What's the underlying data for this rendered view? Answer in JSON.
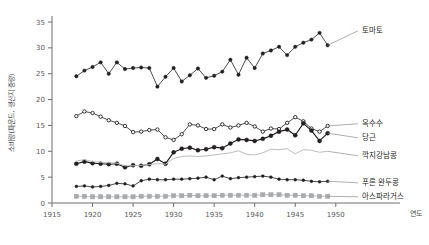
{
  "chart_data": {
    "type": "line",
    "title": "",
    "xlabel": "연도",
    "ylabel": "소비량(파운드, 생산지 중량)",
    "xlim": [
      1915,
      1952
    ],
    "ylim": [
      0,
      35
    ],
    "xticks": [
      1915,
      1920,
      1925,
      1930,
      1935,
      1940,
      1945,
      1950
    ],
    "yticks": [
      0,
      5,
      10,
      15,
      20,
      25,
      30,
      35
    ],
    "grid": false,
    "legend_position": "right-end-labels",
    "x": [
      1918,
      1919,
      1920,
      1921,
      1922,
      1923,
      1924,
      1925,
      1926,
      1927,
      1928,
      1929,
      1930,
      1931,
      1932,
      1933,
      1934,
      1935,
      1936,
      1937,
      1938,
      1939,
      1940,
      1941,
      1942,
      1943,
      1944,
      1945,
      1946,
      1947,
      1948,
      1949
    ],
    "series": [
      {
        "name": "토마토",
        "label": "토마토",
        "color": "#231f20",
        "marker": "circle",
        "values": [
          24.5,
          25.6,
          26.3,
          27.2,
          25.0,
          27.2,
          25.9,
          26.1,
          26.2,
          26.1,
          22.5,
          24.4,
          26.1,
          23.5,
          24.7,
          26.0,
          24.2,
          24.6,
          25.4,
          27.7,
          24.8,
          28.1,
          26.1,
          28.9,
          29.5,
          30.2,
          28.6,
          30.2,
          31.0,
          31.6,
          32.9,
          30.5
        ]
      },
      {
        "name": "옥수수",
        "label": "옥수수",
        "color": "#231f20",
        "marker": "circle-open",
        "values": [
          16.8,
          17.7,
          17.4,
          16.7,
          16.0,
          15.5,
          14.9,
          13.7,
          13.8,
          14.1,
          14.2,
          12.7,
          12.2,
          13.3,
          15.2,
          15.0,
          14.3,
          14.3,
          15.2,
          14.6,
          15.0,
          15.5,
          14.8,
          13.8,
          14.4,
          14.3,
          15.5,
          16.6,
          15.8,
          14.4,
          13.8,
          14.9
        ]
      },
      {
        "name": "당근",
        "label": "당근",
        "color": "#231f20",
        "marker": "circle-filled-bold",
        "values": [
          7.6,
          8.0,
          7.7,
          7.6,
          7.5,
          7.6,
          6.9,
          7.3,
          7.2,
          7.5,
          8.5,
          7.6,
          9.8,
          10.5,
          10.7,
          10.2,
          10.4,
          10.8,
          10.6,
          11.5,
          12.3,
          12.2,
          12.0,
          12.4,
          13.0,
          13.8,
          14.2,
          13.1,
          15.4,
          14.0,
          12.0,
          13.5
        ]
      },
      {
        "name": "깍지강남콩",
        "label": "깍지강남콩",
        "color": "#bcbdc0",
        "marker": "line-only",
        "values": [
          8.1,
          8.4,
          8.0,
          7.9,
          7.8,
          7.7,
          7.2,
          7.2,
          7.3,
          7.4,
          7.6,
          7.5,
          8.6,
          9.0,
          9.1,
          9.0,
          9.1,
          9.3,
          9.5,
          9.7,
          10.1,
          9.4,
          9.3,
          9.7,
          10.4,
          10.3,
          10.5,
          9.5,
          10.3,
          10.2,
          9.8,
          10.0
        ]
      },
      {
        "name": "푸른 완두콩",
        "label": "푸른 완두콩",
        "color": "#231f20",
        "marker": "circle-small",
        "values": [
          3.2,
          3.3,
          3.1,
          3.2,
          3.4,
          3.8,
          3.7,
          3.3,
          4.3,
          4.6,
          4.5,
          4.5,
          4.6,
          4.6,
          4.7,
          4.8,
          5.0,
          4.5,
          5.2,
          4.7,
          4.9,
          5.0,
          5.1,
          5.2,
          5.0,
          4.6,
          4.5,
          4.5,
          4.4,
          4.2,
          4.1,
          4.2
        ]
      },
      {
        "name": "아스파라거스",
        "label": "아스파라거스",
        "color": "#a7a9ac",
        "marker": "square",
        "values": [
          1.3,
          1.3,
          1.2,
          1.2,
          1.2,
          1.2,
          1.2,
          1.2,
          1.3,
          1.3,
          1.3,
          1.3,
          1.4,
          1.4,
          1.5,
          1.4,
          1.4,
          1.4,
          1.5,
          1.5,
          1.5,
          1.5,
          1.5,
          1.6,
          1.6,
          1.6,
          1.5,
          1.5,
          1.4,
          1.4,
          1.3,
          1.3
        ]
      }
    ]
  }
}
